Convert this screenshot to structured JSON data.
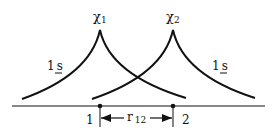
{
  "diagram": {
    "orbitals": [
      {
        "label": "χ",
        "subscript": "1",
        "type_label_main": "1",
        "type_label_sub": "s"
      },
      {
        "label": "χ",
        "subscript": "2",
        "type_label_main": "1",
        "type_label_sub": "s"
      }
    ],
    "atoms": [
      {
        "label": "1"
      },
      {
        "label": "2"
      }
    ],
    "distance": {
      "label": "r",
      "subscript": "12"
    },
    "colors": {
      "stroke": "#111111",
      "background": "#ffffff"
    }
  }
}
